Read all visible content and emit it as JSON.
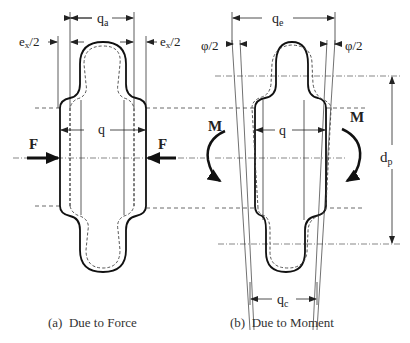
{
  "figure": {
    "panels": [
      {
        "id": "a",
        "caption": "(a)  Due to Force",
        "labels": {
          "qa": "q",
          "qa_sub": "a",
          "ex_left": "e",
          "ex_left_sub": "x",
          "ex_left_tail": "/2",
          "ex_right": "e",
          "ex_right_sub": "x",
          "ex_right_tail": "/2",
          "q": "q",
          "force_left": "F",
          "force_right": "F"
        }
      },
      {
        "id": "b",
        "caption": "(b)  Due to Moment",
        "labels": {
          "qe": "q",
          "qe_sub": "e",
          "phi_left": "φ/2",
          "phi_right": "φ/2",
          "q": "q",
          "moment_left": "M",
          "moment_right": "M",
          "dp": "d",
          "dp_sub": "p",
          "qc": "q",
          "qc_sub": "c"
        }
      }
    ],
    "colors": {
      "stroke": "#1a1a1a",
      "thin": "#333333",
      "background": "#ffffff"
    }
  }
}
